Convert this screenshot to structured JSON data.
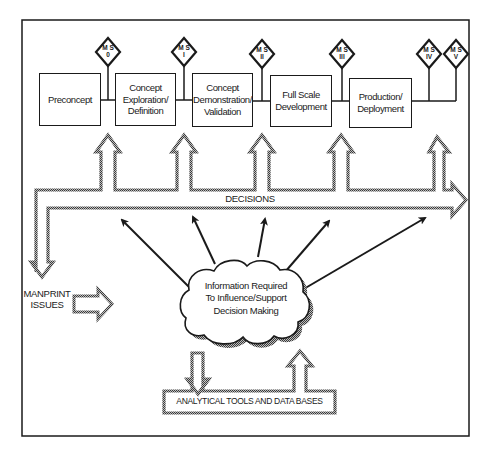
{
  "diagram": {
    "frame": {
      "stroke": "#1a1a1a"
    },
    "phases": [
      {
        "label": "Preconcept"
      },
      {
        "label": "Concept Exploration/ Definition"
      },
      {
        "label": "Concept Demonstration/ Validation"
      },
      {
        "label": "Full Scale Development"
      },
      {
        "label": "Production/ Deployment"
      }
    ],
    "milestones": [
      {
        "line1": "M S",
        "line2": "0"
      },
      {
        "line1": "M S",
        "line2": "I"
      },
      {
        "line1": "M S",
        "line2": "II"
      },
      {
        "line1": "M S",
        "line2": "III"
      },
      {
        "line1": "M S",
        "line2": "IV"
      },
      {
        "line1": "M S",
        "line2": "V"
      }
    ],
    "decisions_label": "DECISIONS",
    "manprint_label_line1": "MANPRINT",
    "manprint_label_line2": "ISSUES",
    "cloud": {
      "line1": "Information Required",
      "line2": "To Influence/Support",
      "line3": "Decision Making"
    },
    "tools_label": "ANALYTICAL TOOLS AND DATA BASES",
    "colors": {
      "ink": "#1a1a1a",
      "hatch": "#6a6a6a",
      "background": "#ffffff"
    }
  }
}
